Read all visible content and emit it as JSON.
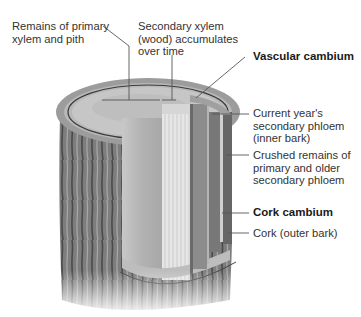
{
  "diagram": {
    "type": "cross-section illustration",
    "colors": {
      "background": "#ffffff",
      "text": "#333333",
      "leader_lines": "#555555",
      "pith": "#bdbdbd",
      "secondary_xylem": "#d8d8d8",
      "phloem": "#8a8a8a",
      "bark": "#7a7a7a"
    },
    "labels": {
      "primary_xylem": {
        "line1": "Remains of primary",
        "line2": "xylem and pith"
      },
      "secondary_xylem": {
        "line1": "Secondary xylem",
        "line2": "(wood) accumulates",
        "line3": "over time"
      },
      "vascular_cambium": {
        "text": "Vascular cambium",
        "bold": true
      },
      "current_phloem": {
        "line1": "Current year's",
        "line2": "secondary phloem",
        "line3": "(inner bark)"
      },
      "crushed_phloem": {
        "line1": "Crushed remains of",
        "line2": "primary and older",
        "line3": "secondary phloem"
      },
      "cork_cambium": {
        "text": "Cork cambium",
        "bold": true
      },
      "cork": {
        "text": "Cork (outer bark)"
      }
    }
  }
}
